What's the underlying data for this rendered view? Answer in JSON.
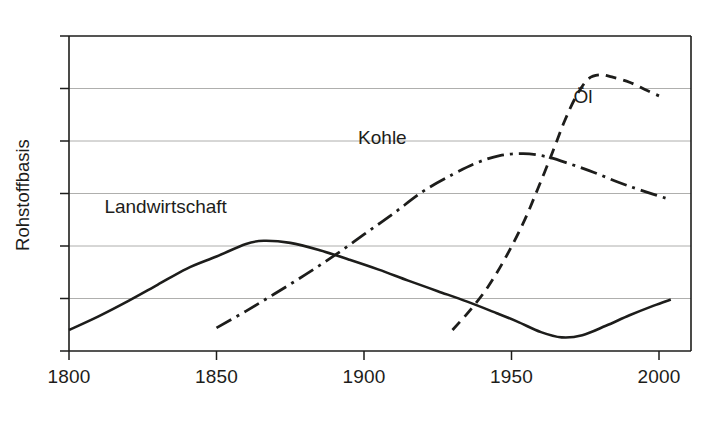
{
  "chart_data": {
    "type": "line",
    "title": "",
    "subtitle": "",
    "xlabel": "",
    "ylabel": "Rohstoffbasis",
    "xlim": [
      1800,
      2010
    ],
    "ylim": [
      0,
      6
    ],
    "x_ticks": [
      1800,
      1850,
      1900,
      1950,
      2000
    ],
    "x_tick_labels": [
      "1800",
      "1850",
      "1900",
      "1950",
      "2000"
    ],
    "y_ticks": [
      0,
      1,
      2,
      3,
      4,
      5,
      6
    ],
    "y_tick_labels": [
      "",
      "",
      "",
      "",
      "",
      "",
      ""
    ],
    "grid": "horizontal",
    "legend": "inline-annotations",
    "annotations": [
      {
        "text": "Landwirtschaft",
        "x": 1812,
        "y": 2.62
      },
      {
        "text": "Kohle",
        "x": 1898,
        "y": 3.95
      },
      {
        "text": "Öl",
        "x": 1971,
        "y": 4.72
      }
    ],
    "series": [
      {
        "name": "Landwirtschaft",
        "style": "solid",
        "points": [
          {
            "x": 1800,
            "y": 0.4
          },
          {
            "x": 1810,
            "y": 0.66
          },
          {
            "x": 1820,
            "y": 0.95
          },
          {
            "x": 1830,
            "y": 1.26
          },
          {
            "x": 1840,
            "y": 1.57
          },
          {
            "x": 1850,
            "y": 1.8
          },
          {
            "x": 1860,
            "y": 2.04
          },
          {
            "x": 1866,
            "y": 2.1
          },
          {
            "x": 1875,
            "y": 2.06
          },
          {
            "x": 1885,
            "y": 1.92
          },
          {
            "x": 1895,
            "y": 1.74
          },
          {
            "x": 1905,
            "y": 1.55
          },
          {
            "x": 1915,
            "y": 1.34
          },
          {
            "x": 1925,
            "y": 1.14
          },
          {
            "x": 1935,
            "y": 0.94
          },
          {
            "x": 1945,
            "y": 0.72
          },
          {
            "x": 1952,
            "y": 0.56
          },
          {
            "x": 1960,
            "y": 0.36
          },
          {
            "x": 1967,
            "y": 0.26
          },
          {
            "x": 1974,
            "y": 0.3
          },
          {
            "x": 1982,
            "y": 0.48
          },
          {
            "x": 1990,
            "y": 0.68
          },
          {
            "x": 1998,
            "y": 0.86
          },
          {
            "x": 2004,
            "y": 0.98
          }
        ]
      },
      {
        "name": "Kohle",
        "style": "dash-dot",
        "points": [
          {
            "x": 1850,
            "y": 0.44
          },
          {
            "x": 1860,
            "y": 0.76
          },
          {
            "x": 1870,
            "y": 1.1
          },
          {
            "x": 1880,
            "y": 1.45
          },
          {
            "x": 1890,
            "y": 1.82
          },
          {
            "x": 1900,
            "y": 2.22
          },
          {
            "x": 1910,
            "y": 2.62
          },
          {
            "x": 1920,
            "y": 3.04
          },
          {
            "x": 1930,
            "y": 3.36
          },
          {
            "x": 1938,
            "y": 3.58
          },
          {
            "x": 1946,
            "y": 3.72
          },
          {
            "x": 1954,
            "y": 3.76
          },
          {
            "x": 1962,
            "y": 3.7
          },
          {
            "x": 1970,
            "y": 3.56
          },
          {
            "x": 1978,
            "y": 3.4
          },
          {
            "x": 1986,
            "y": 3.22
          },
          {
            "x": 1994,
            "y": 3.06
          },
          {
            "x": 2004,
            "y": 2.88
          }
        ]
      },
      {
        "name": "Öl",
        "style": "dashed",
        "points": [
          {
            "x": 1930,
            "y": 0.4
          },
          {
            "x": 1936,
            "y": 0.78
          },
          {
            "x": 1942,
            "y": 1.22
          },
          {
            "x": 1948,
            "y": 1.78
          },
          {
            "x": 1954,
            "y": 2.44
          },
          {
            "x": 1959,
            "y": 3.1
          },
          {
            "x": 1964,
            "y": 3.8
          },
          {
            "x": 1968,
            "y": 4.38
          },
          {
            "x": 1972,
            "y": 4.86
          },
          {
            "x": 1976,
            "y": 5.18
          },
          {
            "x": 1980,
            "y": 5.26
          },
          {
            "x": 1984,
            "y": 5.22
          },
          {
            "x": 1990,
            "y": 5.12
          },
          {
            "x": 1996,
            "y": 4.96
          },
          {
            "x": 2000,
            "y": 4.86
          }
        ]
      }
    ]
  }
}
